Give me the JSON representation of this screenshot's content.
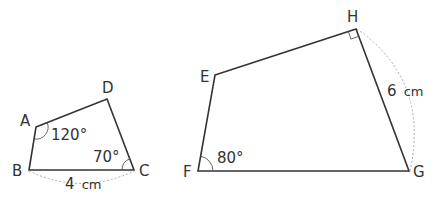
{
  "colors": {
    "stroke": "#333333",
    "dashed": "#aaaaaa",
    "background": "#ffffff"
  },
  "figure1": {
    "vertices": {
      "A": "A",
      "B": "B",
      "C": "C",
      "D": "D"
    },
    "angle_A": "120°",
    "angle_C": "70°",
    "side_BC": "4",
    "side_BC_unit": "cm"
  },
  "figure2": {
    "vertices": {
      "E": "E",
      "F": "F",
      "G": "G",
      "H": "H"
    },
    "angle_F": "80°",
    "angle_H": "right-angle",
    "side_HG": "6",
    "side_HG_unit": "cm"
  }
}
